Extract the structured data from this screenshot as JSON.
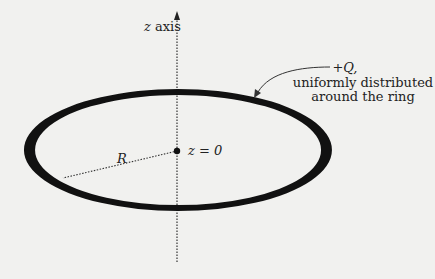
{
  "diagram": {
    "axis_label_var": "z",
    "axis_label_rest": " axis",
    "center_label": "z = 0",
    "radius_label": "R",
    "charge_label": "+Q,",
    "charge_desc_line1": "uniformly distributed",
    "charge_desc_line2": "around the ring",
    "colors": {
      "ring": "#111111",
      "background": "#f1f1ef",
      "text": "#222222"
    }
  }
}
